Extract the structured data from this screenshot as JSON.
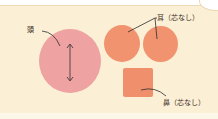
{
  "diagram": {
    "labels": {
      "head": "頭",
      "ears": "耳（芯なし）",
      "nose": "鼻（芯なし）"
    },
    "parts": [
      {
        "name": "head",
        "shape": "circle",
        "color": "#eea2a2"
      },
      {
        "name": "ear-left",
        "shape": "circle",
        "color": "#f0936e"
      },
      {
        "name": "ear-right",
        "shape": "circle",
        "color": "#f0936e"
      },
      {
        "name": "nose",
        "shape": "square",
        "color": "#f08f6b"
      }
    ],
    "background_color": "#fbefd6",
    "annotation": "double-arrow on head indicating height"
  }
}
